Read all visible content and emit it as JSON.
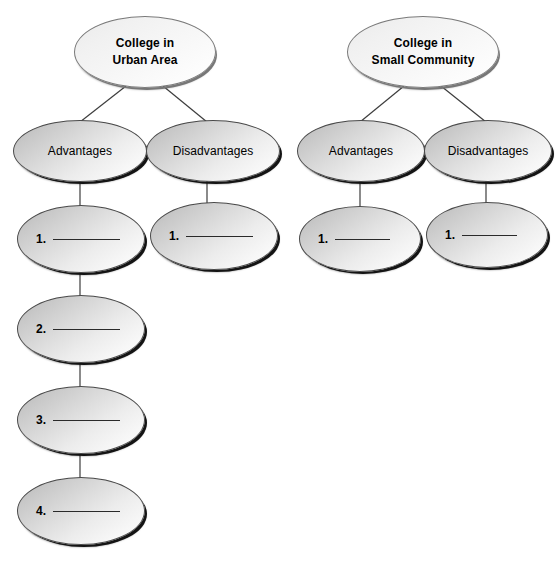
{
  "diagram": {
    "title_hidden": "",
    "background_color": "#ffffff",
    "node_fill_dark": "#b6b6b6",
    "node_fill_light": "#fdfdfd",
    "outline_color": "#4a4a4a",
    "shadow_color": "#141414",
    "blank_line_color": "#2a2a2a"
  },
  "trees": [
    {
      "id": "urban",
      "root": {
        "label": "College in\nUrban Area",
        "line1": "College in",
        "line2": "Urban Area"
      },
      "branches": [
        {
          "id": "urban-advantages",
          "label": "Advantages",
          "items": [
            {
              "number": "1.",
              "value": ""
            },
            {
              "number": "2.",
              "value": ""
            },
            {
              "number": "3.",
              "value": ""
            },
            {
              "number": "4.",
              "value": ""
            }
          ]
        },
        {
          "id": "urban-disadvantages",
          "label": "Disadvantages",
          "items": [
            {
              "number": "1.",
              "value": ""
            }
          ]
        }
      ]
    },
    {
      "id": "small-community",
      "root": {
        "label": "College in\nSmall Community",
        "line1": "College in",
        "line2": "Small Community"
      },
      "branches": [
        {
          "id": "community-advantages",
          "label": "Advantages",
          "items": [
            {
              "number": "1.",
              "value": ""
            }
          ]
        },
        {
          "id": "community-disadvantages",
          "label": "Disadvantages",
          "items": [
            {
              "number": "1.",
              "value": ""
            }
          ]
        }
      ]
    }
  ]
}
